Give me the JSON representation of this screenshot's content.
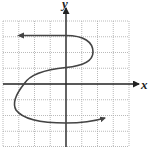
{
  "graph": {
    "x_axis_label": "x",
    "y_axis_label": "y",
    "grid": {
      "x_min": -4,
      "x_max": 4,
      "y_min": -4,
      "y_max": 4,
      "step": 1
    },
    "colors": {
      "grid": "#a8a8a8",
      "axis": "#222222",
      "curve": "#444444",
      "background": "#ffffff"
    },
    "curve": {
      "description": "S-shaped curve with arrows at both ends",
      "start_arrow": {
        "x": -3,
        "y": 3
      },
      "end_arrow": {
        "x": 2.4,
        "y": -2.2
      },
      "key_points": [
        {
          "x": -3,
          "y": 3
        },
        {
          "x": 0,
          "y": 3
        },
        {
          "x": 1.7,
          "y": 2
        },
        {
          "x": 0,
          "y": 1
        },
        {
          "x": -2.6,
          "y": 0
        },
        {
          "x": -3.3,
          "y": -1
        },
        {
          "x": 0,
          "y": -2.5
        },
        {
          "x": 2.4,
          "y": -2.2
        }
      ]
    }
  }
}
